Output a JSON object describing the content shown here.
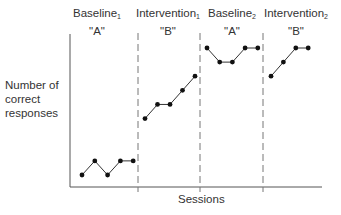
{
  "chart_data": {
    "type": "line",
    "title": "",
    "xlabel": "Sessions",
    "ylabel": "Number of correct responses",
    "grid": false,
    "phases": [
      {
        "name": "Baseline",
        "subscript": "1",
        "code": "\"A\"",
        "sessions": [
          1,
          2,
          3,
          4,
          5
        ],
        "values": [
          1,
          2,
          1,
          2,
          2
        ]
      },
      {
        "name": "Intervention",
        "subscript": "1",
        "code": "\"B\"",
        "sessions": [
          6,
          7,
          8,
          9,
          10
        ],
        "values": [
          5,
          6,
          6,
          7,
          8
        ]
      },
      {
        "name": "Baseline",
        "subscript": "2",
        "code": "\"A\"",
        "sessions": [
          11,
          12,
          13,
          14,
          15
        ],
        "values": [
          10,
          9,
          9,
          10,
          10
        ]
      },
      {
        "name": "Intervention",
        "subscript": "2",
        "code": "\"B\"",
        "sessions": [
          16,
          17,
          18,
          19
        ],
        "values": [
          8,
          9,
          10,
          10
        ]
      }
    ],
    "phase_change_lines": [
      5.5,
      10.5,
      15.5
    ],
    "colors": {
      "line": "#333333",
      "marker": "#111111",
      "axis": "#555555",
      "divider": "#777777"
    }
  },
  "labels": {
    "ylabel_lines": [
      "Number of",
      "correct",
      "responses"
    ],
    "xlabel": "Sessions"
  }
}
